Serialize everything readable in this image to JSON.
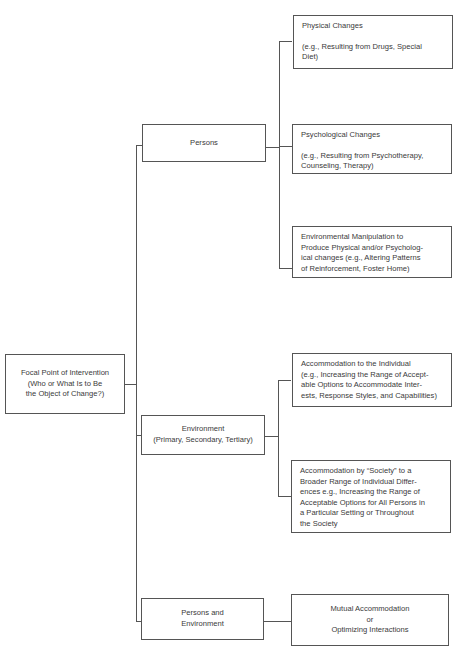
{
  "diagram": {
    "type": "tree",
    "root": {
      "label_lines": [
        "Focal Point of Intervention",
        "(Who or What Is to Be",
        "the Object of Change?)"
      ]
    },
    "branches": [
      {
        "label_lines": [
          "Persons"
        ],
        "children": [
          {
            "title": "Physical Changes",
            "detail_lines": [
              "(e.g., Resulting from Drugs, Special",
              "Diet)"
            ]
          },
          {
            "title": "Psychological Changes",
            "detail_lines": [
              "(e.g., Resulting from Psychotherapy,",
              "Counseling, Therapy)"
            ]
          },
          {
            "lines": [
              "Environmental Manipulation to",
              "Produce Physical and/or Psycholog-",
              "ical changes (e.g., Altering Patterns",
              "of Reinforcement, Foster Home)"
            ]
          }
        ]
      },
      {
        "label_lines": [
          "Environment",
          "(Primary, Secondary, Tertiary)"
        ],
        "children": [
          {
            "lines": [
              "Accommodation to the Individual",
              "(e.g., Increasing the Range of Accept-",
              "able Options to Accommodate Inter-",
              "ests, Response Styles, and Capabilities)"
            ]
          },
          {
            "lines": [
              "Accommodation by “Society” to a",
              "Broader Range of Individual Differ-",
              "ences e.g., Increasing the Range of",
              "Acceptable Options for All Persons in",
              "a Particular Setting or Throughout",
              "the Society"
            ]
          }
        ]
      },
      {
        "label_lines": [
          "Persons and",
          "Environment"
        ],
        "children": [
          {
            "lines": [
              "Mutual Accommodation",
              "or",
              "Optimizing Interactions"
            ]
          }
        ]
      }
    ]
  }
}
